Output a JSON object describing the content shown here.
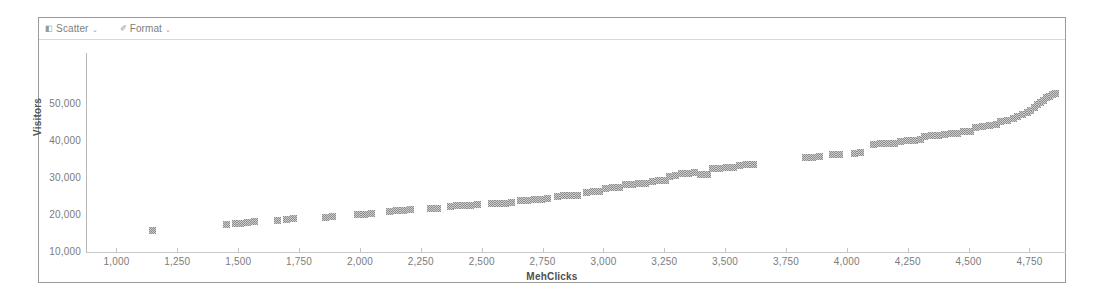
{
  "toolbar": {
    "items": [
      {
        "label": "Scatter",
        "glyph": "◧",
        "chevron": "⌄",
        "icon_name": "chart-type-icon"
      },
      {
        "label": "Format",
        "glyph": "✐",
        "chevron": "⌄",
        "icon_name": "format-brush-icon"
      }
    ]
  },
  "chart_data": {
    "type": "scatter",
    "title": "",
    "xlabel": "MehClicks",
    "ylabel": "Visitors",
    "xlim": [
      875,
      4900
    ],
    "ylim": [
      0,
      54000
    ],
    "grid": true,
    "legend": false,
    "marker": {
      "shape": "square",
      "color": "#8d8d8d",
      "size": 7
    },
    "xticks": [
      1000,
      1250,
      1500,
      1750,
      2000,
      2250,
      2500,
      2750,
      3000,
      3250,
      3500,
      3750,
      4000,
      4250,
      4500,
      4750
    ],
    "xtick_labels": [
      "1,000",
      "1,250",
      "1,500",
      "1,750",
      "2,000",
      "2,250",
      "2,500",
      "2,750",
      "3,000",
      "3,250",
      "3,500",
      "3,750",
      "4,000",
      "4,250",
      "4,500",
      "4,750"
    ],
    "yticks": [
      10000,
      20000,
      30000,
      40000,
      50000
    ],
    "ytick_labels": [
      "10,000",
      "20,000",
      "30,000",
      "40,000",
      "50,000"
    ],
    "points": [
      [
        1150,
        6100
      ],
      [
        1452,
        7600
      ],
      [
        1487,
        8000
      ],
      [
        1510,
        8100
      ],
      [
        1538,
        8300
      ],
      [
        1566,
        8500
      ],
      [
        1660,
        8700
      ],
      [
        1700,
        9100
      ],
      [
        1726,
        9300
      ],
      [
        1860,
        9600
      ],
      [
        1886,
        9900
      ],
      [
        1990,
        10300
      ],
      [
        2020,
        10500
      ],
      [
        2048,
        10600
      ],
      [
        2120,
        11300
      ],
      [
        2150,
        11500
      ],
      [
        2178,
        11600
      ],
      [
        2206,
        11700
      ],
      [
        2290,
        12000
      ],
      [
        2320,
        12100
      ],
      [
        2370,
        12600
      ],
      [
        2398,
        12700
      ],
      [
        2426,
        12800
      ],
      [
        2454,
        12900
      ],
      [
        2482,
        13000
      ],
      [
        2540,
        13300
      ],
      [
        2568,
        13400
      ],
      [
        2596,
        13500
      ],
      [
        2624,
        13600
      ],
      [
        2660,
        14200
      ],
      [
        2688,
        14300
      ],
      [
        2716,
        14400
      ],
      [
        2744,
        14500
      ],
      [
        2772,
        14600
      ],
      [
        2810,
        15200
      ],
      [
        2838,
        15400
      ],
      [
        2866,
        15500
      ],
      [
        2894,
        15600
      ],
      [
        2930,
        16300
      ],
      [
        2958,
        16500
      ],
      [
        2986,
        16600
      ],
      [
        3010,
        17400
      ],
      [
        3038,
        17600
      ],
      [
        3066,
        17700
      ],
      [
        3090,
        18400
      ],
      [
        3118,
        18600
      ],
      [
        3146,
        18700
      ],
      [
        3174,
        18800
      ],
      [
        3200,
        19400
      ],
      [
        3228,
        19600
      ],
      [
        3256,
        19700
      ],
      [
        3270,
        20600
      ],
      [
        3298,
        20800
      ],
      [
        3320,
        21400
      ],
      [
        3348,
        21600
      ],
      [
        3376,
        21700
      ],
      [
        3400,
        21200
      ],
      [
        3428,
        21300
      ],
      [
        3450,
        22700
      ],
      [
        3478,
        22900
      ],
      [
        3506,
        23000
      ],
      [
        3534,
        23100
      ],
      [
        3560,
        23600
      ],
      [
        3588,
        23800
      ],
      [
        3616,
        23900
      ],
      [
        3830,
        25700
      ],
      [
        3858,
        25900
      ],
      [
        3886,
        26000
      ],
      [
        3940,
        26500
      ],
      [
        3968,
        26700
      ],
      [
        4030,
        27000
      ],
      [
        4058,
        27200
      ],
      [
        4110,
        29300
      ],
      [
        4138,
        29500
      ],
      [
        4166,
        29600
      ],
      [
        4194,
        29700
      ],
      [
        4220,
        30200
      ],
      [
        4248,
        30400
      ],
      [
        4276,
        30500
      ],
      [
        4304,
        30600
      ],
      [
        4320,
        31400
      ],
      [
        4348,
        31600
      ],
      [
        4376,
        31700
      ],
      [
        4400,
        32100
      ],
      [
        4428,
        32300
      ],
      [
        4456,
        32400
      ],
      [
        4480,
        32700
      ],
      [
        4508,
        32900
      ],
      [
        4530,
        33800
      ],
      [
        4558,
        34100
      ],
      [
        4586,
        34400
      ],
      [
        4614,
        34700
      ],
      [
        4630,
        35400
      ],
      [
        4658,
        35800
      ],
      [
        4686,
        36200
      ],
      [
        4700,
        36900
      ],
      [
        4720,
        37400
      ],
      [
        4740,
        38000
      ],
      [
        4756,
        38600
      ],
      [
        4770,
        39300
      ],
      [
        4784,
        40000
      ],
      [
        4796,
        40700
      ],
      [
        4808,
        41300
      ],
      [
        4820,
        41900
      ],
      [
        4832,
        42300
      ],
      [
        4844,
        42700
      ],
      [
        4856,
        43000
      ]
    ]
  }
}
